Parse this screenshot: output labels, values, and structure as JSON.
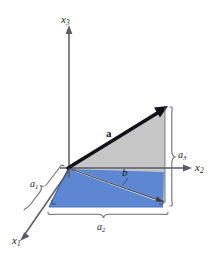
{
  "figure": {
    "background_color": "#ffffff",
    "axes": [
      {
        "id": "x3",
        "base": "x",
        "subscript": "3",
        "label": "x3",
        "direction": "up"
      },
      {
        "id": "x2",
        "base": "x",
        "subscript": "2",
        "label": "x2",
        "direction": "right"
      },
      {
        "id": "x1",
        "base": "x",
        "subscript": "1",
        "label": "x1",
        "direction": "lower-left"
      }
    ],
    "vectors": [
      {
        "id": "a",
        "label": "a",
        "style": "bold",
        "description": "thick bold arrow from origin up-right"
      },
      {
        "id": "b",
        "label": "b",
        "style": "italic",
        "description": "thin arrow from origin down-right in horizontal plane"
      }
    ],
    "components": [
      {
        "id": "a1",
        "base": "a",
        "subscript": "1",
        "label": "a1",
        "brace": "diagonal-left"
      },
      {
        "id": "a2",
        "base": "a",
        "subscript": "2",
        "label": "a2",
        "brace": "horizontal-bottom"
      },
      {
        "id": "a3",
        "base": "a",
        "subscript": "3",
        "label": "a3",
        "brace": "vertical-right"
      }
    ],
    "regions": [
      {
        "id": "gray-triangle",
        "color": "#c6c6c6",
        "description": "vertical shaded plane containing vector a"
      },
      {
        "id": "blue-quad",
        "color": "#5d87d2",
        "description": "horizontal shaded base plane"
      }
    ],
    "colors": {
      "gray_fill": "#c6c6c6",
      "blue_fill": "#5d87d2",
      "blue_edge": "#3a63ad",
      "axis_line": "#5a5a66",
      "vector_a": "#111118",
      "vector_b": "#3c3c46",
      "brace": "#6d6d78",
      "text": "#1a1a22"
    }
  }
}
